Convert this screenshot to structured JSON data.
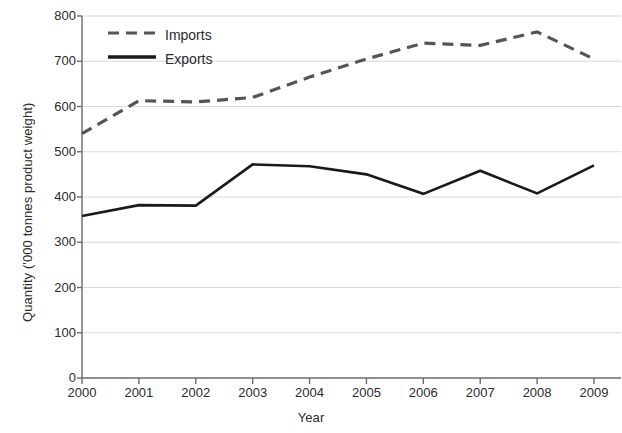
{
  "chart_data": {
    "type": "line",
    "title": "",
    "xlabel": "Year",
    "ylabel": "Quantity ('000 tonnes product weight)",
    "categories": [
      "2000",
      "2001",
      "2002",
      "2003",
      "2004",
      "2005",
      "2006",
      "2007",
      "2008",
      "2009"
    ],
    "x": [
      2000,
      2001,
      2002,
      2003,
      2004,
      2005,
      2006,
      2007,
      2008,
      2009
    ],
    "series": [
      {
        "name": "Imports",
        "style": "dashed",
        "color": "#555555",
        "values": [
          540,
          613,
          610,
          620,
          665,
          705,
          740,
          735,
          765,
          705
        ]
      },
      {
        "name": "Exports",
        "style": "solid",
        "color": "#1a1a1a",
        "values": [
          358,
          382,
          381,
          472,
          468,
          450,
          407,
          458,
          408,
          470
        ]
      }
    ],
    "ylim": [
      0,
      800
    ],
    "yticks": [
      0,
      100,
      200,
      300,
      400,
      500,
      600,
      700,
      800
    ],
    "ytick_labels": [
      "0",
      "100",
      "200",
      "300",
      "400",
      "500",
      "600",
      "700",
      "800"
    ],
    "xtick_labels": [
      "2000",
      "2001",
      "2002",
      "2003",
      "2004",
      "2005",
      "2006",
      "2007",
      "2008",
      "2009"
    ],
    "grid": "horizontal",
    "grid_color": "#d9d9d9",
    "axis_color": "#6b6b6b",
    "legend_position": "top-left",
    "legend": [
      "Imports",
      "Exports"
    ]
  },
  "legend": {
    "imports_label": "Imports",
    "exports_label": "Exports"
  },
  "axes": {
    "x_title": "Year",
    "y_title": "Quantity ('000 tonnes product weight)"
  }
}
